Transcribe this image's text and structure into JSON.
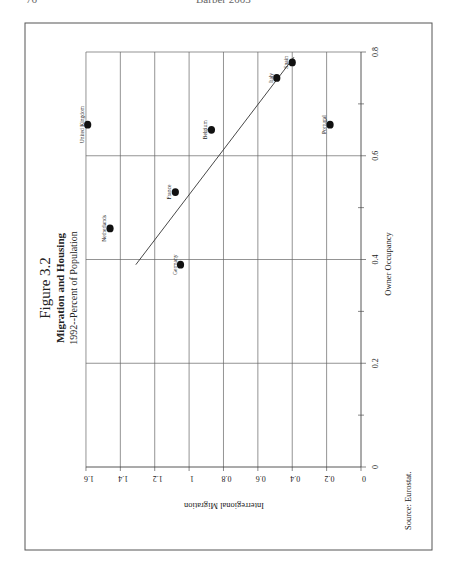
{
  "page_header": {
    "page_number": "76",
    "running_head": "Barber 2003"
  },
  "figure": {
    "title": "Figure 3.2",
    "subtitle": "Migration and Housing",
    "subsubtitle": "1992--Percent of Population",
    "source": "Source:  Eurostat."
  },
  "chart_data": {
    "type": "scatter",
    "title": "Figure 3.2 Migration and Housing",
    "subtitle": "1992--Percent of Population",
    "xlabel": "Owner Occupancy",
    "ylabel": "Interregional Migration",
    "xlim": [
      0,
      0.8
    ],
    "ylim": [
      0,
      1.6
    ],
    "x_ticks": [
      "0",
      "0.2",
      "0.4",
      "0.6",
      "0.8"
    ],
    "y_ticks": [
      "0",
      "0.2",
      "0.4",
      "0.6",
      "0.8",
      "1",
      "1.2",
      "1.4",
      "1.6"
    ],
    "grid": true,
    "orientation_note": "page rotated 90 degrees clockwise",
    "points": [
      {
        "label": "United Kingdom",
        "x": 0.66,
        "y": 1.59
      },
      {
        "label": "Netherlands",
        "x": 0.46,
        "y": 1.46
      },
      {
        "label": "France",
        "x": 0.53,
        "y": 1.08
      },
      {
        "label": "Germany",
        "x": 0.39,
        "y": 1.05
      },
      {
        "label": "Belgium",
        "x": 0.65,
        "y": 0.87
      },
      {
        "label": "Italy",
        "x": 0.75,
        "y": 0.49
      },
      {
        "label": "Spain",
        "x": 0.78,
        "y": 0.4
      },
      {
        "label": "Portugal",
        "x": 0.66,
        "y": 0.18
      }
    ],
    "trend_line": {
      "x": [
        0.39,
        0.79
      ],
      "y": [
        1.31,
        0.39
      ]
    },
    "source": "Source:  Eurostat."
  }
}
